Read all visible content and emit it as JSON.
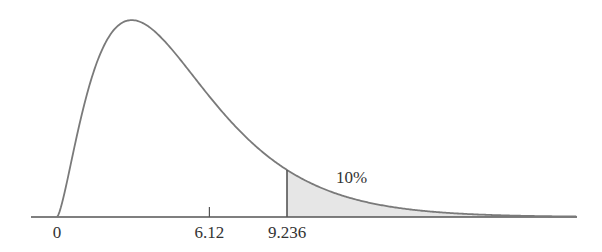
{
  "chart_data": {
    "type": "area",
    "distribution": "chi-square",
    "degrees_of_freedom": 5,
    "title": "",
    "xlabel": "",
    "ylabel": "",
    "x_tick_labels": [
      "0",
      "6.12",
      "9.236"
    ],
    "x_ticks": [
      0,
      6.12,
      9.236
    ],
    "shaded_region": {
      "from": 9.236,
      "to": 20.9,
      "label": "10%"
    },
    "xlim": [
      -1.05,
      20.9
    ],
    "grid": false,
    "legend": null,
    "colors": {
      "curve": "#7a7a7a",
      "axis": "#555555",
      "shade": "#e6e6e6"
    }
  }
}
